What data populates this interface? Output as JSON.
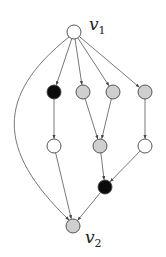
{
  "diagram": {
    "type": "directed-graph",
    "colors": {
      "white": "#ffffff",
      "gray": "#cfcfcf",
      "black": "#0a0a0a",
      "edge": "#555555"
    },
    "labels": {
      "v1": {
        "base": "v",
        "sub": "1"
      },
      "v2": {
        "base": "v",
        "sub": "2"
      }
    },
    "nodes": [
      {
        "id": "v1",
        "x": 74,
        "y": 32,
        "fill": "white"
      },
      {
        "id": "a1",
        "x": 54,
        "y": 92,
        "fill": "black"
      },
      {
        "id": "a2",
        "x": 83,
        "y": 92,
        "fill": "gray"
      },
      {
        "id": "a3",
        "x": 113,
        "y": 92,
        "fill": "gray"
      },
      {
        "id": "a4",
        "x": 145,
        "y": 92,
        "fill": "gray"
      },
      {
        "id": "b1",
        "x": 54,
        "y": 146,
        "fill": "white"
      },
      {
        "id": "b2",
        "x": 100,
        "y": 146,
        "fill": "gray"
      },
      {
        "id": "b3",
        "x": 145,
        "y": 146,
        "fill": "white"
      },
      {
        "id": "c1",
        "x": 105,
        "y": 187,
        "fill": "black"
      },
      {
        "id": "v2",
        "x": 73,
        "y": 226,
        "fill": "gray"
      }
    ],
    "edges": [
      {
        "from": "v1",
        "to": "a1"
      },
      {
        "from": "v1",
        "to": "a2"
      },
      {
        "from": "v1",
        "to": "a3"
      },
      {
        "from": "v1",
        "to": "a4"
      },
      {
        "from": "v1",
        "to": "v2",
        "curved": true
      },
      {
        "from": "a1",
        "to": "b1"
      },
      {
        "from": "a2",
        "to": "b2"
      },
      {
        "from": "a3",
        "to": "b2"
      },
      {
        "from": "a4",
        "to": "b3"
      },
      {
        "from": "b1",
        "to": "v2"
      },
      {
        "from": "b2",
        "to": "c1"
      },
      {
        "from": "b3",
        "to": "c1"
      },
      {
        "from": "c1",
        "to": "v2"
      }
    ]
  }
}
